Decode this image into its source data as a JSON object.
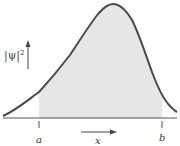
{
  "diagram": {
    "y_label": "|ψ|",
    "y_label_sup": "2",
    "x_label": "x",
    "left_bound_label": "a",
    "right_bound_label": "b",
    "colors": {
      "curve": "#4a4a4a",
      "shade": "#e6e6e6",
      "axis": "#555555",
      "background": "#ffffff"
    },
    "curve_points": [
      [
        3,
        116
      ],
      [
        20,
        106
      ],
      [
        39,
        92
      ],
      [
        60,
        68
      ],
      [
        80,
        40
      ],
      [
        95,
        18
      ],
      [
        105,
        7
      ],
      [
        113,
        4
      ],
      [
        122,
        7
      ],
      [
        132,
        20
      ],
      [
        142,
        44
      ],
      [
        152,
        72
      ],
      [
        162,
        96
      ],
      [
        170,
        106
      ],
      [
        177,
        112
      ]
    ],
    "shaded_range": {
      "from_x": 39,
      "to_x": 162
    }
  }
}
